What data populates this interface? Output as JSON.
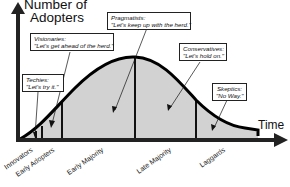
{
  "axes": {
    "y_label_line1": "Number of",
    "y_label_line2": "Adopters",
    "x_label": "Time"
  },
  "categories": [
    {
      "label": "Innovators"
    },
    {
      "label": "Early Adopters"
    },
    {
      "label": "Early Majority"
    },
    {
      "label": "Late Majority"
    },
    {
      "label": "Laggards"
    }
  ],
  "callouts": {
    "techies": {
      "role": "Techies:",
      "quote": "\"Let's try it.\""
    },
    "visionaries": {
      "role": "Visionaries:",
      "quote": "\"Let's get ahead of the herd.\""
    },
    "pragmatists": {
      "role": "Pragmatists:",
      "quote": "\"Let's keep up with the herd.\""
    },
    "conservatives": {
      "role": "Conservatives:",
      "quote": "\"Let's hold on.\""
    },
    "skeptics": {
      "role": "Skeptics:",
      "quote": "\"No Way.\""
    }
  },
  "colors": {
    "curve": "#000000",
    "fill": "#cfcfcf",
    "axis": "#222222"
  }
}
